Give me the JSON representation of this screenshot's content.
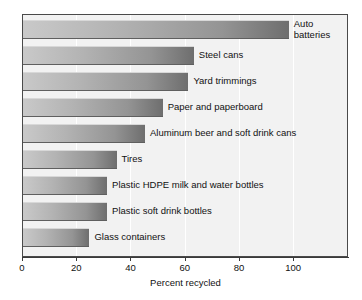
{
  "chart_data": {
    "type": "bar",
    "orientation": "horizontal",
    "title": "",
    "xlabel": "Percent recycled",
    "ylabel": "",
    "xlim": [
      0,
      120
    ],
    "ylim": null,
    "grid": true,
    "legend": null,
    "xticks": [
      0,
      20,
      40,
      60,
      80,
      100
    ],
    "xtick_labels": [
      "0",
      "20",
      "40",
      "60",
      "80",
      "100"
    ],
    "categories": [
      "Auto batteries",
      "Steel cans",
      "Yard trimmings",
      "Paper and paperboard",
      "Aluminum beer and soft drink cans",
      "Tires",
      "Plastic HDPE milk and water bottles",
      "Plastic soft drink bottles",
      "Glass containers"
    ],
    "values": [
      98,
      63,
      61,
      51.5,
      45,
      34.5,
      31,
      31,
      24.5
    ],
    "bars": [
      {
        "label": "Auto batteries",
        "value": 98,
        "label_wrap": true
      },
      {
        "label": "Steel cans",
        "value": 63,
        "label_wrap": false
      },
      {
        "label": "Yard trimmings",
        "value": 61,
        "label_wrap": false
      },
      {
        "label": "Paper and paperboard",
        "value": 51.5,
        "label_wrap": false
      },
      {
        "label": "Aluminum beer and soft drink cans",
        "value": 45,
        "label_wrap": false
      },
      {
        "label": "Tires",
        "value": 34.5,
        "label_wrap": false
      },
      {
        "label": "Plastic HDPE milk and water bottles",
        "value": 31,
        "label_wrap": false
      },
      {
        "label": "Plastic soft drink bottles",
        "value": 31,
        "label_wrap": false
      },
      {
        "label": "Glass containers",
        "value": 24.5,
        "label_wrap": false
      }
    ],
    "colors": {
      "bar_gradient_start": "#c9c9c9",
      "bar_gradient_end": "#6e6e6e",
      "plot_background": "#f2f2f2",
      "gridline": "#ffffff",
      "frame": "#4a4a4a",
      "text": "#111111"
    }
  }
}
